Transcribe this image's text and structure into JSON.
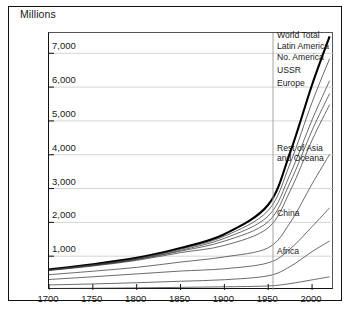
{
  "figure": {
    "y_axis_title": "Millions"
  },
  "chart_data": {
    "type": "line",
    "title": "Millions",
    "xlabel": "",
    "ylabel": "Millions",
    "xlim": [
      1700,
      2025
    ],
    "ylim": [
      0,
      7600
    ],
    "grid": true,
    "legend_position": "right-inline",
    "xticks": [
      1700,
      1750,
      1800,
      1850,
      1900,
      1950,
      2000
    ],
    "xtick_labels": [
      "1700",
      "1750",
      "1800",
      "1850",
      "1900",
      "1950",
      "2000"
    ],
    "yticks": [
      1000,
      2000,
      3000,
      4000,
      5000,
      6000,
      7000
    ],
    "ytick_labels": [
      "1,000",
      "2,000",
      "3,000",
      "4,000",
      "5,000",
      "6,000",
      "7,000"
    ],
    "x": [
      1700,
      1750,
      1800,
      1850,
      1900,
      1950,
      1975,
      2000,
      2020
    ],
    "series": [
      {
        "name": "World Total",
        "label": "World Total",
        "emphasis": "bold",
        "values": [
          610,
          760,
          950,
          1240,
          1650,
          2520,
          4070,
          6070,
          7500
        ]
      },
      {
        "name": "Latin America",
        "label": "Latin America",
        "emphasis": "thin",
        "values": [
          598,
          744,
          930,
          1207,
          1591,
          2354,
          3745,
          5551,
          6840
        ]
      },
      {
        "name": "No. America",
        "label": "No. America",
        "emphasis": "thin",
        "values": [
          588,
          728,
          906,
          1174,
          1527,
          2188,
          3425,
          5031,
          6190
        ]
      },
      {
        "name": "USSR",
        "label": "USSR",
        "emphasis": "thin",
        "values": [
          587,
          724,
          899,
          1148,
          1445,
          2022,
          3183,
          4721,
          5810
        ]
      },
      {
        "name": "Europe",
        "label": "Europe",
        "emphasis": "thin",
        "values": [
          577,
          709,
          876,
          1104,
          1319,
          1841,
          2928,
          4430,
          5480
        ]
      },
      {
        "name": "Rest of Asia and Oceana",
        "label": "Rest of Asia\nand Oceana",
        "emphasis": "thin",
        "values": [
          452,
          556,
          669,
          826,
          978,
          1249,
          1993,
          3137,
          4010
        ]
      },
      {
        "name": "China",
        "label": "China",
        "emphasis": "thin",
        "values": [
          310,
          391,
          476,
          560,
          628,
          804,
          1215,
          1875,
          2430
        ]
      },
      {
        "name": "Africa",
        "label": "Africa",
        "emphasis": "thin",
        "values": [
          150,
          179,
          215,
          259,
          304,
          421,
          694,
          1135,
          1450
        ]
      },
      {
        "name": "Baseline",
        "label": "",
        "emphasis": "thin",
        "values": [
          45,
          52,
          63,
          78,
          94,
          120,
          190,
          300,
          390
        ]
      }
    ],
    "series_labels": [
      {
        "text": "World Total",
        "top": 30,
        "left": 277
      },
      {
        "text": "Latin America",
        "top": 41,
        "left": 277
      },
      {
        "text": "No. America",
        "top": 52,
        "left": 277
      },
      {
        "text": "USSR",
        "top": 65,
        "left": 277
      },
      {
        "text": "Europe",
        "top": 78,
        "left": 277
      },
      {
        "text": "Rest of Asia",
        "top": 143,
        "left": 277
      },
      {
        "text": "and Oceana",
        "top": 153,
        "left": 277
      },
      {
        "text": "China",
        "top": 208,
        "left": 277
      },
      {
        "text": "Africa",
        "top": 246,
        "left": 277
      }
    ]
  },
  "colors": {
    "axis": "#111111",
    "grid": "#c9c9c9",
    "line": "#3a3a3a",
    "world_total": "#000000",
    "background": "#ffffff"
  }
}
